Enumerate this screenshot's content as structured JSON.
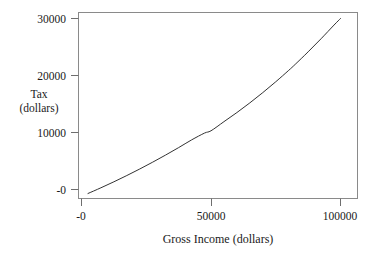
{
  "chart_data": {
    "type": "line",
    "title": "",
    "title_visible_fragment": "",
    "xlabel": "Gross Income (dollars)",
    "ylabel": "Tax (dollars)",
    "ylabel_lines": [
      "Tax",
      "(dollars)"
    ],
    "xlim": [
      -2000,
      108000
    ],
    "ylim": [
      -1500,
      31500
    ],
    "xticks": [
      0,
      50000,
      100000
    ],
    "xtick_labels": [
      "-0",
      "50000",
      "100000"
    ],
    "yticks": [
      0,
      10000,
      20000,
      30000
    ],
    "ytick_labels": [
      "-0",
      "10000",
      "20000",
      "30000"
    ],
    "grid": false,
    "legend": false,
    "series": [
      {
        "name": "Tax",
        "color": "#333333",
        "x": [
          2500,
          7500,
          12500,
          17500,
          22500,
          27500,
          32500,
          37500,
          42500,
          47500,
          50000,
          55000,
          60000,
          65000,
          70000,
          75000,
          80000,
          82500,
          87500,
          92500,
          97500,
          100000
        ],
        "y": [
          -700,
          300,
          1350,
          2450,
          3600,
          4800,
          6050,
          7350,
          8700,
          9900,
          10300,
          11900,
          13500,
          15200,
          17000,
          18900,
          20900,
          21950,
          24150,
          26450,
          28850,
          30000
        ]
      }
    ]
  },
  "axis": {
    "y_tick_labels": [
      {
        "text": "30000",
        "value": 30000
      },
      {
        "text": "20000",
        "value": 20000
      },
      {
        "text": "10000",
        "value": 10000
      },
      {
        "text": "-0",
        "value": 0
      }
    ],
    "x_tick_labels": [
      {
        "text": "-0",
        "value": 0
      },
      {
        "text": "50000",
        "value": 50000
      },
      {
        "text": "100000",
        "value": 100000
      }
    ]
  },
  "colors": {
    "background": "#ffffff",
    "axis": "#6e6e6e",
    "curve": "#333333",
    "text": "#1a1a1a",
    "title_faded": "#b9b9b9"
  }
}
